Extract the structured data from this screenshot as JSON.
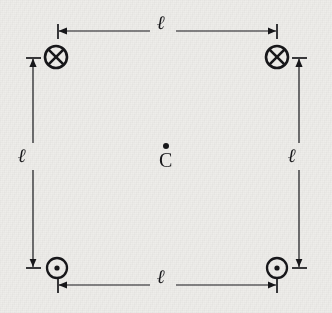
{
  "figure": {
    "background_color": "#eeedea",
    "ink_color": "#17171a",
    "width": 332,
    "height": 313
  },
  "center_point": {
    "label": "C",
    "marker": "dot",
    "name": "center-point-C",
    "x": 166,
    "y": 157
  },
  "wires": [
    {
      "position": "top-left",
      "direction": "into-page",
      "symbol": "⊗",
      "icon_name": "current-into-page-icon",
      "x": 56,
      "y": 57,
      "radius": 11
    },
    {
      "position": "top-right",
      "direction": "into-page",
      "symbol": "⊗",
      "icon_name": "current-into-page-icon",
      "x": 277,
      "y": 57,
      "radius": 11
    },
    {
      "position": "bottom-left",
      "direction": "out-of-page",
      "symbol": "⊙",
      "icon_name": "current-out-of-page-icon",
      "x": 57,
      "y": 268,
      "radius": 10
    },
    {
      "position": "bottom-right",
      "direction": "out-of-page",
      "symbol": "⊙",
      "icon_name": "current-out-of-page-icon",
      "x": 277,
      "y": 268,
      "radius": 10
    }
  ],
  "dimensions": [
    {
      "side": "top",
      "label": "ℓ",
      "orientation": "horizontal",
      "name": "dimension-top",
      "from": 58,
      "to": 277,
      "axis": 31,
      "label_x": 160,
      "label_y": 22
    },
    {
      "side": "left",
      "label": "ℓ",
      "orientation": "vertical",
      "name": "dimension-left",
      "from": 58,
      "to": 268,
      "axis": 33,
      "label_x": 24,
      "label_y": 154
    },
    {
      "side": "right",
      "label": "ℓ",
      "orientation": "vertical",
      "name": "dimension-right",
      "from": 58,
      "to": 268,
      "axis": 299,
      "label_x": 291,
      "label_y": 154
    },
    {
      "side": "bottom",
      "label": "ℓ",
      "orientation": "horizontal",
      "name": "dimension-bottom",
      "from": 58,
      "to": 277,
      "axis": 285,
      "label_x": 160,
      "label_y": 276
    }
  ]
}
